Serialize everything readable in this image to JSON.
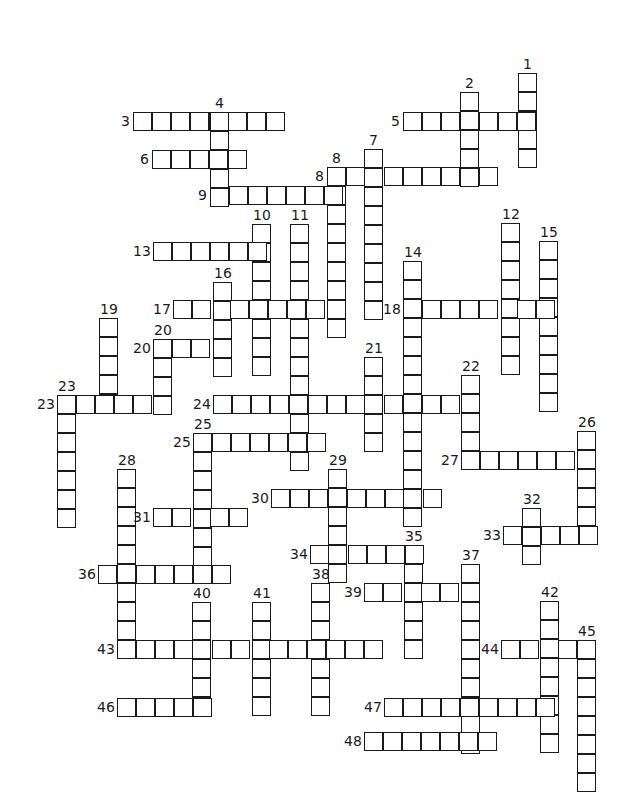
{
  "puzzle": {
    "type": "crossword",
    "cell_size": 19,
    "line_color": "#1a1a1a",
    "background": "#ffffff",
    "words": [
      {
        "num": "1",
        "dir": "down",
        "x": 518,
        "y": 73,
        "len": 5
      },
      {
        "num": "2",
        "dir": "down",
        "x": 460,
        "y": 92,
        "len": 5
      },
      {
        "num": "3",
        "dir": "across",
        "x": 133,
        "y": 112,
        "len": 8
      },
      {
        "num": "4",
        "dir": "down",
        "x": 210,
        "y": 112,
        "len": 5
      },
      {
        "num": "5",
        "dir": "across",
        "x": 403,
        "y": 112,
        "len": 7
      },
      {
        "num": "6",
        "dir": "across",
        "x": 152,
        "y": 150,
        "len": 5
      },
      {
        "num": "7",
        "dir": "down",
        "x": 364,
        "y": 149,
        "len": 9
      },
      {
        "num": "8",
        "dir": "across",
        "x": 327,
        "y": 167,
        "len": 9
      },
      {
        "num": "8",
        "dir": "down",
        "x": 327,
        "y": 167,
        "len": 9
      },
      {
        "num": "9",
        "dir": "across",
        "x": 210,
        "y": 186,
        "len": 7
      },
      {
        "num": "10",
        "dir": "down",
        "x": 252,
        "y": 224,
        "len": 8
      },
      {
        "num": "11",
        "dir": "down",
        "x": 290,
        "y": 224,
        "len": 13
      },
      {
        "num": "12",
        "dir": "down",
        "x": 501,
        "y": 223,
        "len": 8
      },
      {
        "num": "13",
        "dir": "across",
        "x": 153,
        "y": 242,
        "len": 6
      },
      {
        "num": "14",
        "dir": "down",
        "x": 403,
        "y": 261,
        "len": 14
      },
      {
        "num": "15",
        "dir": "down",
        "x": 539,
        "y": 241,
        "len": 9
      },
      {
        "num": "16",
        "dir": "down",
        "x": 213,
        "y": 282,
        "len": 5
      },
      {
        "num": "17",
        "dir": "across",
        "x": 173,
        "y": 300,
        "len": 8
      },
      {
        "num": "18",
        "dir": "across",
        "x": 403,
        "y": 300,
        "len": 8
      },
      {
        "num": "19",
        "dir": "down",
        "x": 99,
        "y": 318,
        "len": 5
      },
      {
        "num": "20",
        "dir": "across",
        "x": 153,
        "y": 339,
        "len": 4
      },
      {
        "num": "20",
        "dir": "down",
        "x": 153,
        "y": 339,
        "len": 4
      },
      {
        "num": "21",
        "dir": "down",
        "x": 364,
        "y": 357,
        "len": 5
      },
      {
        "num": "22",
        "dir": "down",
        "x": 461,
        "y": 375,
        "len": 5
      },
      {
        "num": "23",
        "dir": "across",
        "x": 57,
        "y": 395,
        "len": 6
      },
      {
        "num": "23",
        "dir": "down",
        "x": 57,
        "y": 395,
        "len": 7
      },
      {
        "num": "24",
        "dir": "across",
        "x": 213,
        "y": 395,
        "len": 14
      },
      {
        "num": "25",
        "dir": "across",
        "x": 193,
        "y": 433,
        "len": 7
      },
      {
        "num": "25",
        "dir": "down",
        "x": 193,
        "y": 433,
        "len": 7
      },
      {
        "num": "26",
        "dir": "down",
        "x": 577,
        "y": 431,
        "len": 6
      },
      {
        "num": "27",
        "dir": "across",
        "x": 461,
        "y": 451,
        "len": 7
      },
      {
        "num": "28",
        "dir": "down",
        "x": 117,
        "y": 469,
        "len": 9
      },
      {
        "num": "29",
        "dir": "down",
        "x": 328,
        "y": 469,
        "len": 6
      },
      {
        "num": "30",
        "dir": "across",
        "x": 271,
        "y": 489,
        "len": 9
      },
      {
        "num": "31",
        "dir": "across",
        "x": 153,
        "y": 508,
        "len": 5
      },
      {
        "num": "32",
        "dir": "down",
        "x": 522,
        "y": 508,
        "len": 3
      },
      {
        "num": "33",
        "dir": "across",
        "x": 503,
        "y": 526,
        "len": 5
      },
      {
        "num": "34",
        "dir": "across",
        "x": 310,
        "y": 545,
        "len": 6
      },
      {
        "num": "35",
        "dir": "down",
        "x": 404,
        "y": 545,
        "len": 6
      },
      {
        "num": "36",
        "dir": "across",
        "x": 98,
        "y": 565,
        "len": 7
      },
      {
        "num": "37",
        "dir": "down",
        "x": 461,
        "y": 564,
        "len": 10
      },
      {
        "num": "38",
        "dir": "down",
        "x": 311,
        "y": 583,
        "len": 7
      },
      {
        "num": "39",
        "dir": "across",
        "x": 364,
        "y": 583,
        "len": 6
      },
      {
        "num": "40",
        "dir": "down",
        "x": 192,
        "y": 602,
        "len": 6
      },
      {
        "num": "41",
        "dir": "down",
        "x": 252,
        "y": 602,
        "len": 6
      },
      {
        "num": "42",
        "dir": "down",
        "x": 540,
        "y": 601,
        "len": 8
      },
      {
        "num": "43",
        "dir": "across",
        "x": 117,
        "y": 640,
        "len": 14
      },
      {
        "num": "44",
        "dir": "across",
        "x": 501,
        "y": 640,
        "len": 5
      },
      {
        "num": "45",
        "dir": "down",
        "x": 577,
        "y": 640,
        "len": 8
      },
      {
        "num": "46",
        "dir": "across",
        "x": 117,
        "y": 698,
        "len": 5
      },
      {
        "num": "47",
        "dir": "across",
        "x": 384,
        "y": 698,
        "len": 9
      },
      {
        "num": "48",
        "dir": "across",
        "x": 364,
        "y": 732,
        "len": 7
      }
    ]
  }
}
